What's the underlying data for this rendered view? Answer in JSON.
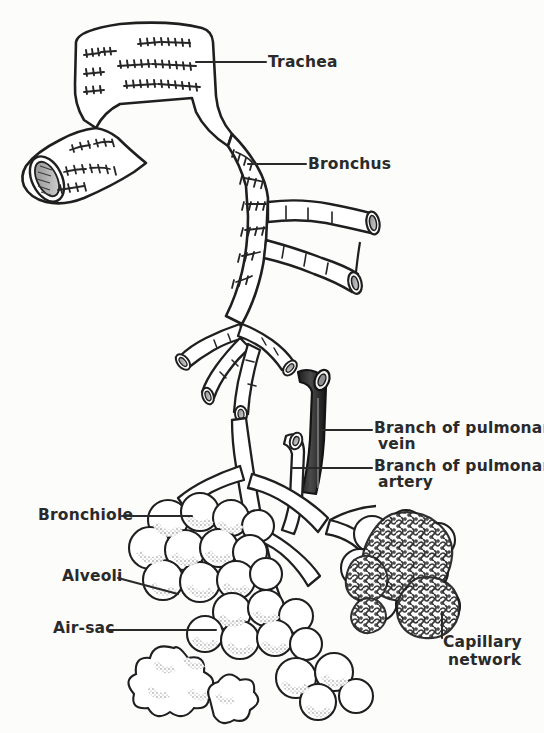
{
  "figure": {
    "kind": "anatomical-line-drawing",
    "paper_color": "#fcfcfb",
    "ink_color": "#1f1f1f",
    "shade_color": "#6f6f6f"
  },
  "labels": {
    "trachea": "Trachea",
    "bronchus": "Bronchus",
    "branch_pulmonary_vein_line1": "Branch of pulmonary",
    "branch_pulmonary_vein_line2": "vein",
    "branch_pulmonary_artery_line1": "Branch of pulmonary",
    "branch_pulmonary_artery_line2": "artery",
    "bronchiole": "Bronchiole",
    "alveoli": "Alveoli",
    "air_sac": "Air-sac",
    "capillary_network_line1": "Capillary",
    "capillary_network_line2": "network"
  },
  "structures": [
    {
      "name": "trachea",
      "note": "vertical tube at top with cartilage rings"
    },
    {
      "name": "left-main-bronchus",
      "note": "cut stump at left showing elliptical lumen"
    },
    {
      "name": "right-main-bronchus",
      "note": "descends to the right with cartilage rings"
    },
    {
      "name": "secondary-bronchi",
      "note": "two cut branches at right"
    },
    {
      "name": "bronchioles",
      "note": "thin branching airways below"
    },
    {
      "name": "pulmonary-vein",
      "note": "dark shaded vessel"
    },
    {
      "name": "pulmonary-artery",
      "note": "light shaded vessel"
    },
    {
      "name": "alveolar-clusters",
      "note": "grape-like lobed sacs"
    },
    {
      "name": "capillary-network",
      "note": "dense stippled mesh over alveoli at right"
    }
  ]
}
